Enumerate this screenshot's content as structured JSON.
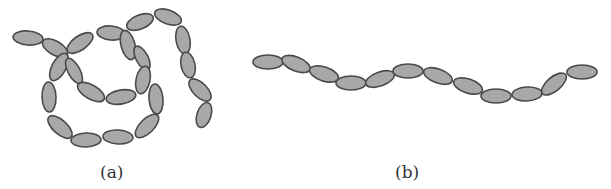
{
  "figure": {
    "panels": [
      {
        "id": "a",
        "caption": "(a)",
        "description": "tangled / looped chain of ellipses",
        "segments": [
          {
            "cx": 28,
            "cy": 38,
            "rx": 15,
            "ry": 7,
            "rot": 5
          },
          {
            "cx": 55,
            "cy": 48,
            "rx": 14,
            "ry": 7,
            "rot": 30
          },
          {
            "cx": 80,
            "cy": 43,
            "rx": 15,
            "ry": 7,
            "rot": -35
          },
          {
            "cx": 111,
            "cy": 33,
            "rx": 14,
            "ry": 7,
            "rot": 5
          },
          {
            "cx": 140,
            "cy": 22,
            "rx": 14,
            "ry": 7,
            "rot": -22
          },
          {
            "cx": 168,
            "cy": 17,
            "rx": 14,
            "ry": 7,
            "rot": 20
          },
          {
            "cx": 183,
            "cy": 40,
            "rx": 14,
            "ry": 7,
            "rot": 80
          },
          {
            "cx": 188,
            "cy": 65,
            "rx": 13,
            "ry": 7,
            "rot": 78
          },
          {
            "cx": 200,
            "cy": 90,
            "rx": 14,
            "ry": 7,
            "rot": 45
          },
          {
            "cx": 204,
            "cy": 115,
            "rx": 13,
            "ry": 7,
            "rot": -72
          },
          {
            "cx": 128,
            "cy": 45,
            "rx": 15,
            "ry": 7,
            "rot": 75
          },
          {
            "cx": 142,
            "cy": 58,
            "rx": 13,
            "ry": 6,
            "rot": 62
          },
          {
            "cx": 143,
            "cy": 80,
            "rx": 14,
            "ry": 7,
            "rot": -78
          },
          {
            "cx": 156,
            "cy": 99,
            "rx": 15,
            "ry": 7,
            "rot": 85
          },
          {
            "cx": 147,
            "cy": 126,
            "rx": 15,
            "ry": 7,
            "rot": -45
          },
          {
            "cx": 118,
            "cy": 137,
            "rx": 15,
            "ry": 7,
            "rot": 3
          },
          {
            "cx": 86,
            "cy": 140,
            "rx": 15,
            "ry": 7,
            "rot": -2
          },
          {
            "cx": 60,
            "cy": 127,
            "rx": 15,
            "ry": 7,
            "rot": 42
          },
          {
            "cx": 49,
            "cy": 97,
            "rx": 15,
            "ry": 7,
            "rot": 88
          },
          {
            "cx": 59,
            "cy": 67,
            "rx": 15,
            "ry": 7,
            "rot": -62
          },
          {
            "cx": 74,
            "cy": 71,
            "rx": 14,
            "ry": 6,
            "rot": 62
          },
          {
            "cx": 91,
            "cy": 92,
            "rx": 15,
            "ry": 7,
            "rot": 30
          },
          {
            "cx": 121,
            "cy": 97,
            "rx": 15,
            "ry": 7,
            "rot": -10
          }
        ]
      },
      {
        "id": "b",
        "caption": "(b)",
        "description": "extended wavy chain of ellipses",
        "segments": [
          {
            "cx": 268,
            "cy": 62,
            "rx": 15,
            "ry": 7,
            "rot": 0
          },
          {
            "cx": 296,
            "cy": 64,
            "rx": 15,
            "ry": 7,
            "rot": 22
          },
          {
            "cx": 324,
            "cy": 74,
            "rx": 15,
            "ry": 7,
            "rot": 18
          },
          {
            "cx": 351,
            "cy": 83,
            "rx": 15,
            "ry": 7,
            "rot": 0
          },
          {
            "cx": 380,
            "cy": 79,
            "rx": 15,
            "ry": 7,
            "rot": -20
          },
          {
            "cx": 408,
            "cy": 71,
            "rx": 15,
            "ry": 7,
            "rot": 0
          },
          {
            "cx": 438,
            "cy": 76,
            "rx": 15,
            "ry": 7,
            "rot": 20
          },
          {
            "cx": 468,
            "cy": 86,
            "rx": 15,
            "ry": 7,
            "rot": 18
          },
          {
            "cx": 496,
            "cy": 96,
            "rx": 15,
            "ry": 7,
            "rot": 0
          },
          {
            "cx": 527,
            "cy": 94,
            "rx": 15,
            "ry": 7,
            "rot": -3
          },
          {
            "cx": 554,
            "cy": 84,
            "rx": 15,
            "ry": 7,
            "rot": -40
          },
          {
            "cx": 582,
            "cy": 72,
            "rx": 15,
            "ry": 7,
            "rot": 0
          }
        ]
      }
    ],
    "colors": {
      "fill": "#a8a8a8",
      "stroke": "#4a4a4a",
      "caption": "#333333",
      "background": "#ffffff"
    }
  }
}
